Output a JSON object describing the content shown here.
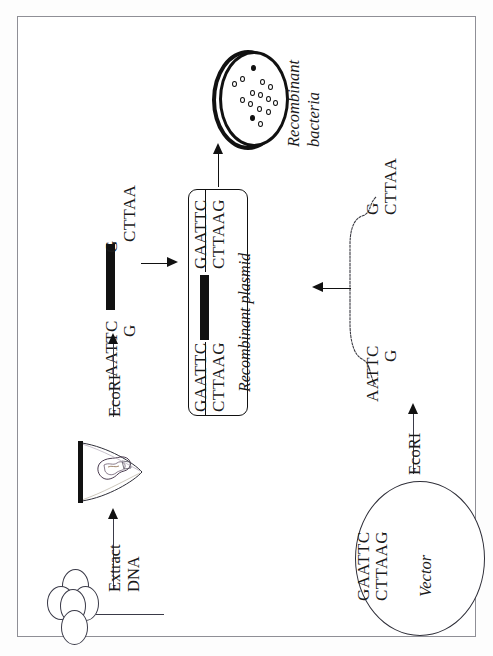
{
  "figure": {
    "orientation": "rotated-90-ccw",
    "border_color": "#8f8f96",
    "ink_color": "#111111"
  },
  "labels": {
    "recombinant_bacteria": "Recombinant\nbacteria",
    "recombinant_bacteria_line1": "Recombinant",
    "recombinant_bacteria_line2": "bacteria",
    "recombinant_plasmid": "Recombinant  plasmid",
    "vector": "Vector",
    "extract_line1": "Extract",
    "extract_line2": "DNA",
    "ecori_left": "EcoRI",
    "ecori_right": "EcoRI"
  },
  "sequences": {
    "fragment_top_left": "AATTC",
    "fragment_top_right": "G",
    "fragment_bottom_left": "G",
    "fragment_bottom_right": "CTTAA",
    "plasmid_left_top": "GAATTC",
    "plasmid_left_bottom": "CTTAAG",
    "plasmid_right_top": "GAATTC",
    "plasmid_right_bottom": "CTTAAG",
    "vector_top": "GAATTC",
    "vector_bottom": "CTTAAG",
    "linear_vector_left_top": "AATTC",
    "linear_vector_left_bottom": "G",
    "linear_vector_right_top": "G",
    "linear_vector_right_bottom": "CTTAA"
  },
  "petri_dish": {
    "name": "petri-dish",
    "colony_count": 14,
    "filled_colony_count": 2,
    "colonies": [
      {
        "x": 31,
        "y": 16,
        "filled": true
      },
      {
        "x": 20,
        "y": 27,
        "filled": false
      },
      {
        "x": 12,
        "y": 31,
        "filled": false
      },
      {
        "x": 40,
        "y": 29,
        "filled": false
      },
      {
        "x": 49,
        "y": 33,
        "filled": false
      },
      {
        "x": 30,
        "y": 40,
        "filled": false
      },
      {
        "x": 38,
        "y": 41,
        "filled": false
      },
      {
        "x": 20,
        "y": 46,
        "filled": false
      },
      {
        "x": 28,
        "y": 50,
        "filled": false
      },
      {
        "x": 46,
        "y": 45,
        "filled": false
      },
      {
        "x": 53,
        "y": 49,
        "filled": false
      },
      {
        "x": 37,
        "y": 54,
        "filled": false
      },
      {
        "x": 46,
        "y": 57,
        "filled": false
      },
      {
        "x": 30,
        "y": 63,
        "filled": true
      },
      {
        "x": 38,
        "y": 68,
        "filled": false
      }
    ]
  },
  "cells": {
    "name": "bacterial-cell-cluster",
    "count": 5
  },
  "arrows": [
    {
      "name": "arrow-plasmid-to-dish",
      "direction": "up"
    },
    {
      "name": "arrow-fragment-to-plasmid",
      "direction": "right"
    },
    {
      "name": "arrow-vector-to-plasmid",
      "direction": "left"
    },
    {
      "name": "arrow-ecori-digest-genomic",
      "direction": "up"
    },
    {
      "name": "arrow-extract-dna",
      "direction": "up"
    },
    {
      "name": "arrow-ecori-digest-vector",
      "direction": "up"
    }
  ]
}
